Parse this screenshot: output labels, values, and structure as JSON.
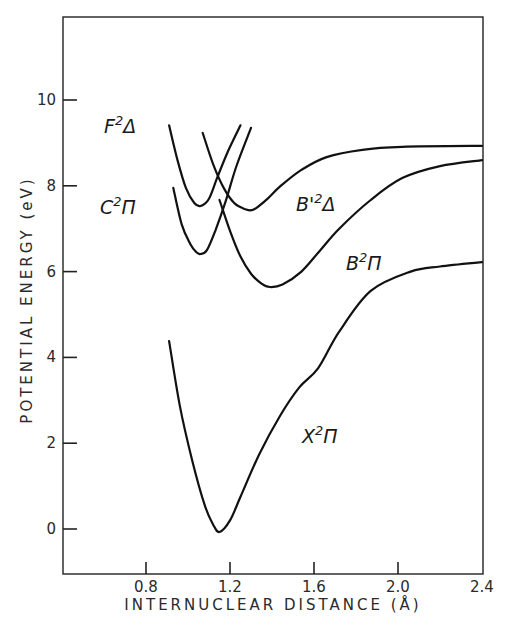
{
  "chart_data": {
    "type": "line",
    "title": "",
    "xlabel": "INTERNUCLEAR DISTANCE (Å)",
    "ylabel": "POTENTIAL ENERGY (eV)",
    "xlim": [
      0.5,
      2.4
    ],
    "ylim": [
      -1.05,
      12.0
    ],
    "xticks": [
      0.8,
      1.2,
      1.6,
      2.0,
      2.4
    ],
    "yticks": [
      0,
      2,
      4,
      6,
      8,
      10
    ],
    "grid": false,
    "legend": "none (curves labeled inline)",
    "series": [
      {
        "name": "X²Π",
        "label_main": "X",
        "label_sup": "2",
        "label_term": "Π",
        "x": [
          0.91,
          0.96,
          1.02,
          1.08,
          1.12,
          1.15,
          1.2,
          1.25,
          1.34,
          1.44,
          1.53,
          1.62,
          1.72,
          1.87,
          2.06,
          2.2,
          2.4
        ],
        "y": [
          4.38,
          2.9,
          1.6,
          0.55,
          0.1,
          -0.07,
          0.2,
          0.75,
          1.75,
          2.65,
          3.3,
          3.75,
          4.6,
          5.55,
          6.0,
          6.12,
          6.22
        ]
      },
      {
        "name": "C²Π",
        "label_main": "C",
        "label_sup": "2",
        "label_term": "Π",
        "x": [
          0.93,
          0.97,
          1.01,
          1.04,
          1.06,
          1.09,
          1.13,
          1.18,
          1.23,
          1.3
        ],
        "y": [
          7.95,
          7.1,
          6.65,
          6.45,
          6.41,
          6.5,
          6.95,
          7.65,
          8.45,
          9.35
        ]
      },
      {
        "name": "F²Δ",
        "label_main": "F",
        "label_sup": "2",
        "label_term": "Δ",
        "x": [
          0.91,
          0.95,
          0.99,
          1.03,
          1.06,
          1.1,
          1.14,
          1.19,
          1.25
        ],
        "y": [
          9.41,
          8.6,
          7.95,
          7.6,
          7.53,
          7.7,
          8.2,
          8.8,
          9.41
        ]
      },
      {
        "name": "B'²Δ",
        "label_main": "B'",
        "label_sup": "2",
        "label_term": "Δ",
        "x": [
          1.07,
          1.12,
          1.17,
          1.22,
          1.27,
          1.31,
          1.37,
          1.44,
          1.54,
          1.66,
          1.83,
          2.02,
          2.4
        ],
        "y": [
          9.23,
          8.5,
          7.95,
          7.6,
          7.46,
          7.44,
          7.66,
          7.99,
          8.37,
          8.67,
          8.84,
          8.91,
          8.93
        ]
      },
      {
        "name": "B²Π",
        "label_main": "B",
        "label_sup": "2",
        "label_term": "Π",
        "x": [
          1.15,
          1.2,
          1.25,
          1.3,
          1.35,
          1.39,
          1.45,
          1.54,
          1.63,
          1.72,
          1.87,
          2.02,
          2.2,
          2.4
        ],
        "y": [
          7.67,
          6.95,
          6.35,
          5.95,
          5.72,
          5.64,
          5.7,
          6.0,
          6.5,
          7.0,
          7.67,
          8.18,
          8.46,
          8.6
        ]
      }
    ],
    "annotations": [
      {
        "text": "F²Δ",
        "x": 0.8,
        "y": 9.1
      },
      {
        "text": "C²Π",
        "x": 0.78,
        "y": 7.6
      },
      {
        "text": "B'²Δ",
        "x": 1.55,
        "y": 7.6
      },
      {
        "text": "B²Π",
        "x": 1.6,
        "y": 6.05
      },
      {
        "text": "X²Π",
        "x": 1.62,
        "y": 2.15
      }
    ]
  },
  "axes": {
    "x_title": "INTERNUCLEAR DISTANCE (Å)",
    "y_title": "POTENTIAL ENERGY (eV)",
    "x_tick_labels": [
      "0.8",
      "1.2",
      "1.6",
      "2.0",
      "2.4"
    ],
    "y_tick_labels": [
      "0",
      "2",
      "4",
      "6",
      "8",
      "10"
    ]
  }
}
